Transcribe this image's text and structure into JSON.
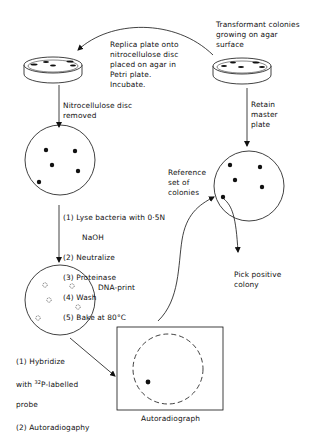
{
  "labels": {
    "transformant": "Transformant colonies\ngrowing on agar\nsurface",
    "replica": "Replica plate onto\nnitrocellulose disc\nplaced on agar in\nPetri plate.\nIncubate.",
    "disc_removed": "Nitrocellulose disc\nremoved",
    "retain": "Retain\nmaster\nplate",
    "reference": "Reference\nset of\ncolonies",
    "steps_1": "(1) Lyse bacteria with 0·5N",
    "steps_1b": "NaOH",
    "steps_2": "(2) Neutralize",
    "steps_3": "(3) Proteinase",
    "steps_4": "(4) Wash",
    "steps_5": "(5) Bake at 80°C",
    "dna_print": "DNA-print",
    "pick": "Pick positive\ncolony",
    "hyb_1a": "(1) Hybridize",
    "hyb_1b_pre": "with ",
    "hyb_1b_sup": "32",
    "hyb_1b_post": "P-labelled",
    "hyb_1c": "probe",
    "hyb_2": "(2) Autoradiogaphy",
    "autoradiograph": "Autoradiograph"
  },
  "colors": {
    "ink": "#111111",
    "background": "#ffffff"
  }
}
